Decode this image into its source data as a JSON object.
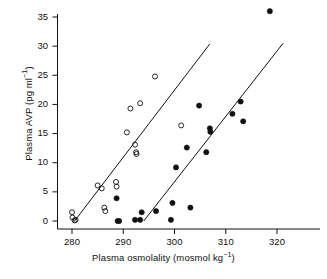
{
  "chart": {
    "type": "scatter",
    "title": "",
    "xlabel_text": "Plasma osmolality (mosmol kg",
    "xlabel_sup": "−1",
    "xlabel_tail": ")",
    "ylabel_text": "Plasma AVP (pg ml",
    "ylabel_sup": "−1",
    "ylabel_tail": ")",
    "xlabel_full": "Plasma osmolality (mosmol kg⁻¹)",
    "ylabel_full": "Plasma AVP (pg ml⁻¹)",
    "xticks": [
      280,
      290,
      300,
      310,
      320
    ],
    "yticks": [
      0,
      5,
      10,
      15,
      20,
      25,
      30,
      35
    ],
    "xlim": [
      277.5,
      325.0
    ],
    "ylim": [
      -1.5,
      37.0
    ],
    "grid": false,
    "legend": "none",
    "axis_color": "#111111",
    "marker_color": "#111111"
  },
  "chart_data": {
    "type": "scatter",
    "title": "",
    "xlabel": "Plasma osmolality (mosmol kg⁻¹)",
    "ylabel": "Plasma AVP (pg ml⁻¹)",
    "xlim": [
      277.5,
      325.0
    ],
    "ylim": [
      -1.5,
      37.0
    ],
    "xticks": [
      280,
      290,
      300,
      310,
      320
    ],
    "yticks": [
      0,
      5,
      10,
      15,
      20,
      25,
      30,
      35
    ],
    "grid": false,
    "legend": "none",
    "series": [
      {
        "name": "open-circles",
        "marker": "open-circle",
        "points": [
          [
            280.0,
            1.5
          ],
          [
            280.1,
            0.6
          ],
          [
            280.5,
            0.1
          ],
          [
            280.7,
            0.2
          ],
          [
            285.0,
            6.1
          ],
          [
            285.8,
            5.6
          ],
          [
            286.3,
            2.3
          ],
          [
            286.5,
            1.7
          ],
          [
            288.6,
            6.7
          ],
          [
            288.7,
            5.9
          ],
          [
            290.7,
            15.2
          ],
          [
            291.4,
            19.3
          ],
          [
            292.3,
            13.1
          ],
          [
            292.5,
            11.8
          ],
          [
            292.6,
            11.5
          ],
          [
            293.3,
            20.2
          ],
          [
            296.2,
            24.8
          ],
          [
            301.3,
            16.4
          ]
        ],
        "fit_line": {
          "x": [
            280.5,
            306.9
          ],
          "y": [
            0.0,
            30.4
          ]
        }
      },
      {
        "name": "filled-circles",
        "marker": "filled-circle",
        "points": [
          [
            288.7,
            3.9
          ],
          [
            288.9,
            0.0
          ],
          [
            289.2,
            0.0
          ],
          [
            292.3,
            0.2
          ],
          [
            293.3,
            0.2
          ],
          [
            293.6,
            1.5
          ],
          [
            296.4,
            1.7
          ],
          [
            299.3,
            0.2
          ],
          [
            299.6,
            3.1
          ],
          [
            300.3,
            9.2
          ],
          [
            302.4,
            12.6
          ],
          [
            303.1,
            2.3
          ],
          [
            304.8,
            19.8
          ],
          [
            306.2,
            11.8
          ],
          [
            306.9,
            15.9
          ],
          [
            307.0,
            15.3
          ],
          [
            311.3,
            18.4
          ],
          [
            312.9,
            20.5
          ],
          [
            313.4,
            17.1
          ],
          [
            318.6,
            36.0
          ]
        ],
        "fit_line": {
          "x": [
            294.0,
            321.2
          ],
          "y": [
            0.0,
            30.5
          ]
        }
      }
    ]
  }
}
